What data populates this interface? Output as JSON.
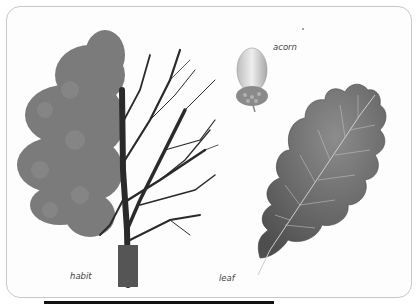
{
  "illustration": {
    "subject": "oak tree botanical plate",
    "labels": {
      "acorn": "acorn",
      "habit": "habit",
      "leaf": "leaf"
    },
    "colors": {
      "frame_border": "#c8c8c8",
      "foliage": "#6b6b6b",
      "branches": "#2a2a2a",
      "leaf": "#6a6a6a",
      "acorn": "#cfcfcf"
    }
  }
}
